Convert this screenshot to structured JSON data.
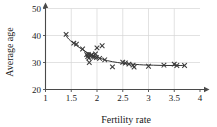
{
  "chart_data": {
    "type": "scatter",
    "title": "",
    "xlabel": "Fertility rate",
    "ylabel": "Average age",
    "xlim": [
      1,
      4
    ],
    "ylim": [
      20,
      50
    ],
    "xticks": [
      1,
      1.5,
      2,
      2.5,
      3,
      3.5,
      4
    ],
    "xticklabels": [
      "1",
      "1.5",
      "2",
      "2.5",
      "3",
      "3.5",
      "4"
    ],
    "yticks": [
      20,
      30,
      40,
      50
    ],
    "yticklabels": [
      "20",
      "30",
      "40",
      "50"
    ],
    "grid": true,
    "legend": "none",
    "marker": "x",
    "series": [
      {
        "name": "countries",
        "marker": "x",
        "points": [
          [
            1.4,
            40.4
          ],
          [
            1.55,
            37.2
          ],
          [
            1.6,
            36.8
          ],
          [
            1.72,
            35.0
          ],
          [
            1.8,
            32.9
          ],
          [
            1.82,
            32.2
          ],
          [
            1.83,
            33.0
          ],
          [
            1.84,
            31.6
          ],
          [
            1.85,
            30.0
          ],
          [
            1.88,
            32.6
          ],
          [
            1.9,
            32.8
          ],
          [
            1.92,
            32.3
          ],
          [
            1.95,
            32.0
          ],
          [
            1.97,
            33.2
          ],
          [
            1.99,
            31.8
          ],
          [
            2.0,
            35.4
          ],
          [
            2.05,
            31.5
          ],
          [
            2.1,
            36.2
          ],
          [
            2.15,
            31.0
          ],
          [
            2.3,
            28.4
          ],
          [
            2.5,
            30.1
          ],
          [
            2.55,
            29.8
          ],
          [
            2.62,
            29.4
          ],
          [
            2.7,
            29.0
          ],
          [
            2.72,
            28.3
          ],
          [
            3.0,
            28.6
          ],
          [
            3.3,
            29.0
          ],
          [
            3.5,
            29.4
          ],
          [
            3.55,
            28.9
          ],
          [
            3.7,
            28.9
          ]
        ]
      }
    ],
    "fit_curve": {
      "name": "fitted trend",
      "points": [
        [
          1.38,
          40.3
        ],
        [
          1.45,
          38.7
        ],
        [
          1.52,
          37.5
        ],
        [
          1.6,
          36.3
        ],
        [
          1.7,
          35.0
        ],
        [
          1.8,
          33.8
        ],
        [
          1.9,
          32.8
        ],
        [
          2.0,
          32.0
        ],
        [
          2.1,
          31.3
        ],
        [
          2.2,
          30.7
        ],
        [
          2.3,
          30.3
        ],
        [
          2.4,
          30.0
        ],
        [
          2.5,
          29.7
        ],
        [
          2.6,
          29.5
        ],
        [
          2.75,
          29.3
        ],
        [
          2.9,
          29.1
        ],
        [
          3.1,
          29.0
        ],
        [
          3.3,
          28.9
        ],
        [
          3.5,
          28.9
        ],
        [
          3.7,
          28.9
        ]
      ]
    }
  }
}
